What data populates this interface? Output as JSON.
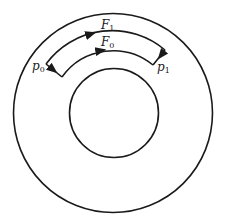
{
  "figure": {
    "type": "annulus-path-diagram",
    "colors": {
      "stroke": "#1a1a1a",
      "background": "#ffffff"
    },
    "outer_circle": {
      "cx": 113,
      "cy": 113,
      "r": 99.5
    },
    "inner_circle": {
      "cx": 114,
      "cy": 113,
      "r": 44.5
    },
    "paths": [
      {
        "id": "F1",
        "label_main": "F",
        "label_sub": "1",
        "radius": 82,
        "direction": "clockwise (left to right)"
      },
      {
        "id": "F0",
        "label_main": "F",
        "label_sub": "0",
        "radius": 63,
        "direction": "clockwise (left to right)"
      }
    ],
    "connectors": [
      {
        "id": "p0-connector",
        "from": "F1 left end",
        "to": "F0 left end"
      },
      {
        "id": "p1-connector",
        "from": "F1 right end",
        "to": "F0 right end"
      }
    ],
    "points": [
      {
        "id": "p0",
        "label_main": "p",
        "label_sub": "0"
      },
      {
        "id": "p1",
        "label_main": "p",
        "label_sub": "1"
      }
    ]
  }
}
